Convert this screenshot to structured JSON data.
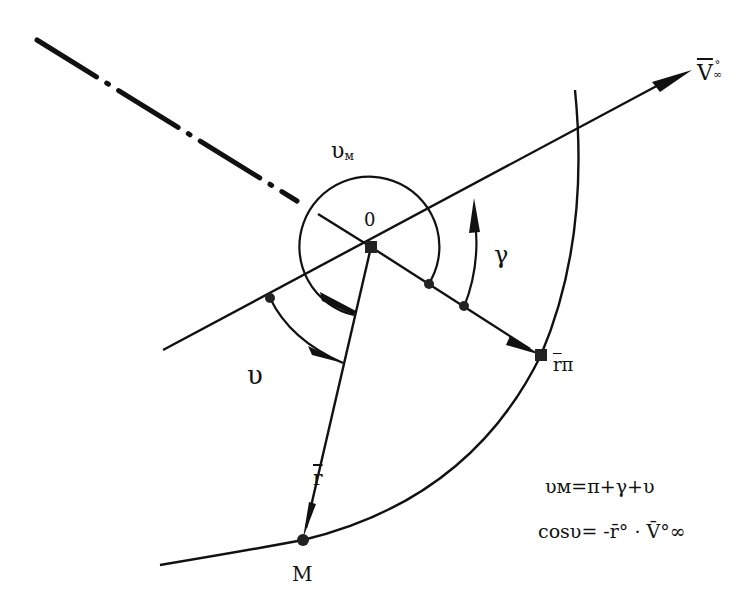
{
  "diagram": {
    "labels": {
      "center": "0",
      "true_anomaly_max": "υ",
      "true_anomaly_max_sub": "м",
      "gamma": "γ",
      "upsilon": "υ",
      "radius_vector": "r",
      "point_M": "M",
      "periapsis_vector": "r",
      "periapsis_sub": "π",
      "velocity_inf": "V",
      "velocity_inf_sup": "°",
      "velocity_inf_sub": "∞"
    },
    "formulas": [
      "υм=π+γ+υ",
      "cosυ= -r̄° · V̄°∞"
    ],
    "points": {
      "O": [
        371,
        247
      ],
      "M": [
        303,
        540
      ],
      "r_pi": [
        541,
        355
      ],
      "v_inf_tip": [
        692,
        70
      ]
    },
    "colors": {
      "stroke": "#111111",
      "background": "#ffffff"
    }
  }
}
